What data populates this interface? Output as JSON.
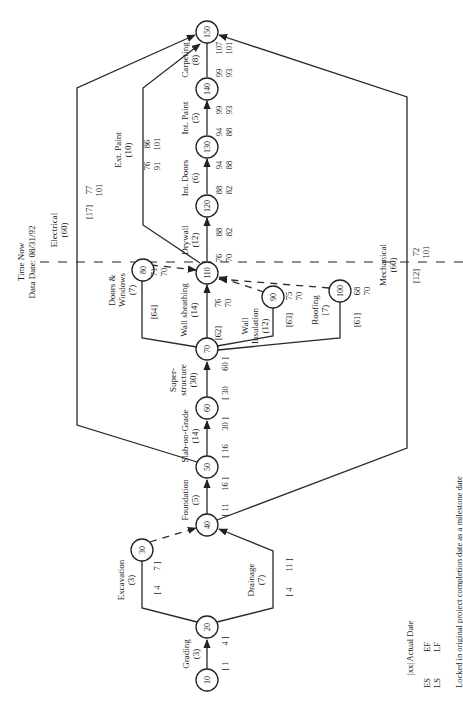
{
  "time_now": {
    "label": "Time Now",
    "data_date_label": "Data Date: 08/31/92"
  },
  "legend": {
    "actual_date": "|xx|  Actual Date",
    "es": "ES",
    "ef": "EF",
    "ls": "LS",
    "lf": "LF",
    "note": "Locked in original project completion date as a milestone date"
  },
  "nodes": [
    "10",
    "20",
    "30",
    "40",
    "50",
    "60",
    "70",
    "80",
    "90",
    "100",
    "110",
    "120",
    "130",
    "140",
    "150"
  ],
  "activities": {
    "grading": {
      "name": "Grading",
      "dur": "(3)",
      "es": "[ 1",
      "ef": "4 ]"
    },
    "excavation": {
      "name": "Excavation",
      "dur": "(3)",
      "es": "[ 4",
      "ef": "7 ]"
    },
    "drainage": {
      "name": "Drainage",
      "dur": "(7)",
      "es": "[ 4",
      "ef": "11 ]"
    },
    "foundation": {
      "name": "Foundation",
      "dur": "(5)",
      "es": "[ 11",
      "ef": "16 ]"
    },
    "slab": {
      "name": "Slab-on-Grade",
      "dur": "(14)",
      "es": "[ 16",
      "ef": "30 ]"
    },
    "superstructure": {
      "name1": "Super-",
      "name2": "structure",
      "dur": "(30)",
      "es": "[ 30",
      "ef": "60 ]"
    },
    "doors_windows": {
      "name1": "Doors &",
      "name2": "Windows",
      "dur": "(7)",
      "es": "[64]",
      "ef": "71",
      "lf": "70"
    },
    "wall_sheathing": {
      "name": "Wall sheathing",
      "dur": "(14)",
      "es": "[62]",
      "ef": "76",
      "lf": "70"
    },
    "wall_insulation": {
      "name1": "Wall",
      "name2": "Insulation",
      "dur": "(12)",
      "es": "[63]",
      "ef": "75",
      "lf": "70"
    },
    "roofing": {
      "name": "Roofing",
      "dur": "[7)",
      "es": "[61]",
      "ef": "68",
      "lf": "70"
    },
    "electrical": {
      "name": "Electrical",
      "dur": "(60)",
      "es": "[17]",
      "ef": "77",
      "lf": "101"
    },
    "mechanical": {
      "name": "Mechanical",
      "dur": "(60)",
      "es": "[12]",
      "ef": "72",
      "lf": "101"
    },
    "drywall": {
      "name": "Drywall",
      "dur": "(12)",
      "es": "76",
      "ef": "88",
      "ls": "70",
      "lf": "82"
    },
    "ext_paint": {
      "name": "Ext. Paint",
      "dur": "(10)",
      "es": "76",
      "ef": "86",
      "ls": "91",
      "lf": "101"
    },
    "int_doors": {
      "name": "Int. Doors",
      "dur": "(6)",
      "es": "88",
      "ef": "94",
      "ls": "82",
      "lf": "88"
    },
    "int_paint": {
      "name": "Int. Paint",
      "dur": "(5)",
      "es": "94",
      "ef": "99",
      "ls": "88",
      "lf": "93"
    },
    "carpeting": {
      "name": "Carpeting",
      "dur": "(8)",
      "es": "99",
      "ef": "107",
      "ls": "93",
      "lf": "101"
    }
  }
}
